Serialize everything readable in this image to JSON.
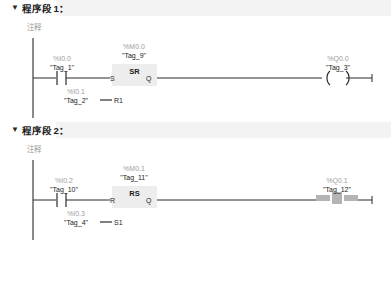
{
  "app": {
    "editor": "LAD ladder editor",
    "collapse_icon": "▼"
  },
  "networks": [
    {
      "id": "network-1",
      "title_prefix": "程序段",
      "number": "1",
      "colon": "：",
      "comment": "注释",
      "collapsed": false,
      "elements": {
        "contact": {
          "address": "%I0.0",
          "tag": "\"Tag_1\"",
          "type": "normally-open-contact"
        },
        "block": {
          "address": "%M0.0",
          "tag": "\"Tag_9\"",
          "name": "SR",
          "inputs": [
            {
              "label": "S",
              "source_address": "",
              "source_tag": ""
            },
            {
              "label": "R1",
              "source_address": "%I0.1",
              "source_tag": "\"Tag_2\""
            }
          ],
          "outputs": [
            {
              "label": "Q"
            }
          ]
        },
        "coil": {
          "address": "%Q0.0",
          "tag": "\"Tag_3\"",
          "type": "output-coil",
          "selected": false
        }
      }
    },
    {
      "id": "network-2",
      "title_prefix": "程序段",
      "number": "2",
      "colon": "：",
      "comment": "注释",
      "collapsed": false,
      "elements": {
        "contact": {
          "address": "%I0.2",
          "tag": "\"Tag_10\"",
          "type": "normally-open-contact"
        },
        "block": {
          "address": "%M0.1",
          "tag": "\"Tag_11\"",
          "name": "RS",
          "inputs": [
            {
              "label": "R",
              "source_address": "",
              "source_tag": ""
            },
            {
              "label": "S1",
              "source_address": "%I0.3",
              "source_tag": "\"Tag_4\""
            }
          ],
          "outputs": [
            {
              "label": "Q"
            }
          ]
        },
        "coil": {
          "address": "%Q0.1",
          "tag": "\"Tag_12\"",
          "type": "output-coil",
          "selected": true
        }
      }
    }
  ],
  "colors": {
    "rail": "#2b2b2b",
    "wire": "#2b2b2b",
    "address_text": "#9d9d9d",
    "tag_text": "#232323",
    "block_fill": "#ededed",
    "header_bar": "#f3f3f3",
    "selection": "#b4b4b4",
    "comment_text": "#9a9a9a"
  }
}
